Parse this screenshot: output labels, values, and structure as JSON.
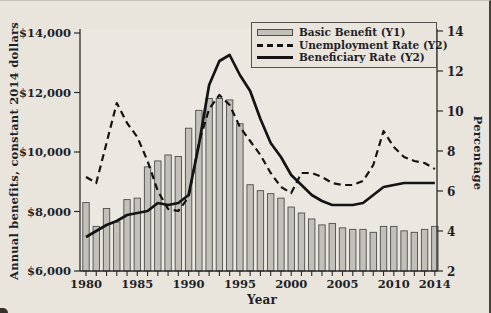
{
  "figure": {
    "left_axis_title": "Annual benefits, constant 2014 dollars",
    "right_axis_title": "Percentage",
    "x_axis_title": "Year"
  },
  "legend": {
    "position": "top-right",
    "items": [
      {
        "label": "Basic Benefit (Y1)",
        "swatch": "bar-swatch"
      },
      {
        "label": "Unemployment Rate (Y2)",
        "swatch": "dashed-line-swatch"
      },
      {
        "label": "Beneficiary Rate (Y2)",
        "swatch": "solid-line-swatch"
      }
    ]
  },
  "colors": {
    "background": "#e9e5dc",
    "plot_background": "#ebe8e1",
    "bar_fill": "#c2c0b9",
    "bar_stroke": "#4d4d4d",
    "line_color": "#141414",
    "axis_color": "#2a2a2a",
    "text_color": "#1f1f29"
  },
  "chart_data": {
    "type": "bar",
    "subtype": "combo-bar-and-two-lines",
    "title": "",
    "xlabel": "Year",
    "ylabel_left": "Annual benefits, constant 2014 dollars",
    "ylabel_right": "Percentage",
    "grid": false,
    "x": [
      1980,
      1981,
      1982,
      1983,
      1984,
      1985,
      1986,
      1987,
      1988,
      1989,
      1990,
      1991,
      1992,
      1993,
      1994,
      1995,
      1996,
      1997,
      1998,
      1999,
      2000,
      2001,
      2002,
      2003,
      2004,
      2005,
      2006,
      2007,
      2008,
      2009,
      2010,
      2011,
      2012,
      2013,
      2014
    ],
    "series": [
      {
        "name": "Basic Benefit (Y1)",
        "type": "bar",
        "axis": "left",
        "values": [
          8300,
          7500,
          8100,
          7650,
          8400,
          8450,
          9500,
          9700,
          9900,
          9850,
          10800,
          11400,
          11800,
          11800,
          11750,
          10950,
          8900,
          8700,
          8600,
          8450,
          8150,
          7950,
          7750,
          7550,
          7600,
          7450,
          7400,
          7400,
          7300,
          7500,
          7500,
          7350,
          7300,
          7400,
          7500
        ]
      },
      {
        "name": "Unemployment Rate (Y2)",
        "type": "line",
        "style": "dashed",
        "axis": "right",
        "values": [
          6.7,
          6.4,
          8.4,
          10.4,
          9.4,
          8.7,
          7.5,
          6.0,
          5.1,
          5.0,
          5.7,
          8.4,
          10.1,
          10.8,
          10.3,
          9.2,
          8.5,
          7.8,
          6.9,
          6.2,
          5.9,
          6.9,
          6.9,
          6.7,
          6.4,
          6.3,
          6.3,
          6.5,
          7.3,
          9.0,
          8.2,
          7.7,
          7.5,
          7.4,
          7.1
        ]
      },
      {
        "name": "Beneficiary Rate (Y2)",
        "type": "line",
        "style": "solid",
        "axis": "right",
        "values": [
          3.7,
          4.0,
          4.3,
          4.5,
          4.8,
          4.9,
          5.0,
          5.4,
          5.3,
          5.4,
          5.8,
          8.3,
          11.3,
          12.5,
          12.8,
          11.8,
          11.0,
          9.6,
          8.4,
          7.7,
          6.8,
          6.3,
          5.8,
          5.5,
          5.3,
          5.3,
          5.3,
          5.4,
          5.8,
          6.2,
          6.3,
          6.4,
          6.4,
          6.4,
          6.4
        ]
      }
    ],
    "axes": {
      "left": {
        "range": [
          6000,
          14000
        ],
        "ticks": [
          {
            "v": 6000,
            "label": "$6,000"
          },
          {
            "v": 8000,
            "label": "$8,000"
          },
          {
            "v": 10000,
            "label": "$10,000"
          },
          {
            "v": 12000,
            "label": "$12,000"
          },
          {
            "v": 14000,
            "label": "$14,000"
          }
        ]
      },
      "right": {
        "range": [
          2,
          14
        ],
        "ticks": [
          {
            "v": 2,
            "label": "2"
          },
          {
            "v": 4,
            "label": "4"
          },
          {
            "v": 6,
            "label": "6"
          },
          {
            "v": 8,
            "label": "8"
          },
          {
            "v": 10,
            "label": "10"
          },
          {
            "v": 12,
            "label": "12"
          },
          {
            "v": 14,
            "label": "14"
          }
        ]
      },
      "x": {
        "range": [
          1980,
          2014
        ],
        "labeled_ticks": [
          {
            "v": 1980,
            "label": "1980"
          },
          {
            "v": 1985,
            "label": "1985"
          },
          {
            "v": 1990,
            "label": "1990"
          },
          {
            "v": 1995,
            "label": "1995"
          },
          {
            "v": 2000,
            "label": "2000"
          },
          {
            "v": 2005,
            "label": "2005"
          },
          {
            "v": 2010,
            "label": "2010"
          },
          {
            "v": 2014,
            "label": "2014"
          }
        ]
      }
    }
  }
}
